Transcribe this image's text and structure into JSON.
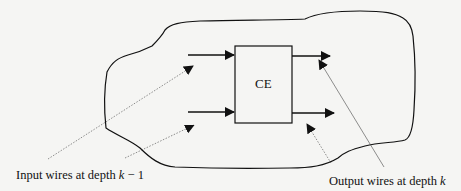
{
  "diagram": {
    "node": {
      "label": "CE"
    },
    "input_label": {
      "text": "Input wires at depth ",
      "var": "k",
      "suffix": " − 1"
    },
    "output_label": {
      "text": "Output wires at depth ",
      "var": "k"
    },
    "colors": {
      "stroke": "#111111",
      "background": "#f5f5f3",
      "pointer": "#555555"
    }
  }
}
